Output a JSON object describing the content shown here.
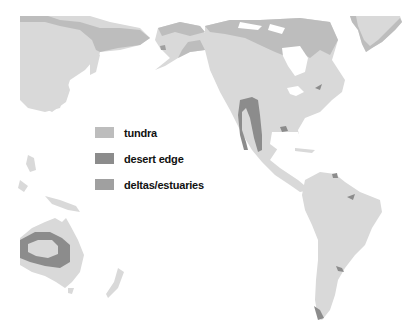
{
  "map": {
    "colors": {
      "land": "#d9d9d9",
      "tundra": "#bdbdbd",
      "desert_edge": "#8c8c8c",
      "deltas_estuaries": "#a0a0a0",
      "ocean": "#ffffff"
    }
  },
  "legend": {
    "items": [
      {
        "label": "tundra",
        "color": "#bdbdbd"
      },
      {
        "label": "desert edge",
        "color": "#8c8c8c"
      },
      {
        "label": "deltas/estuaries",
        "color": "#a0a0a0"
      }
    ]
  }
}
